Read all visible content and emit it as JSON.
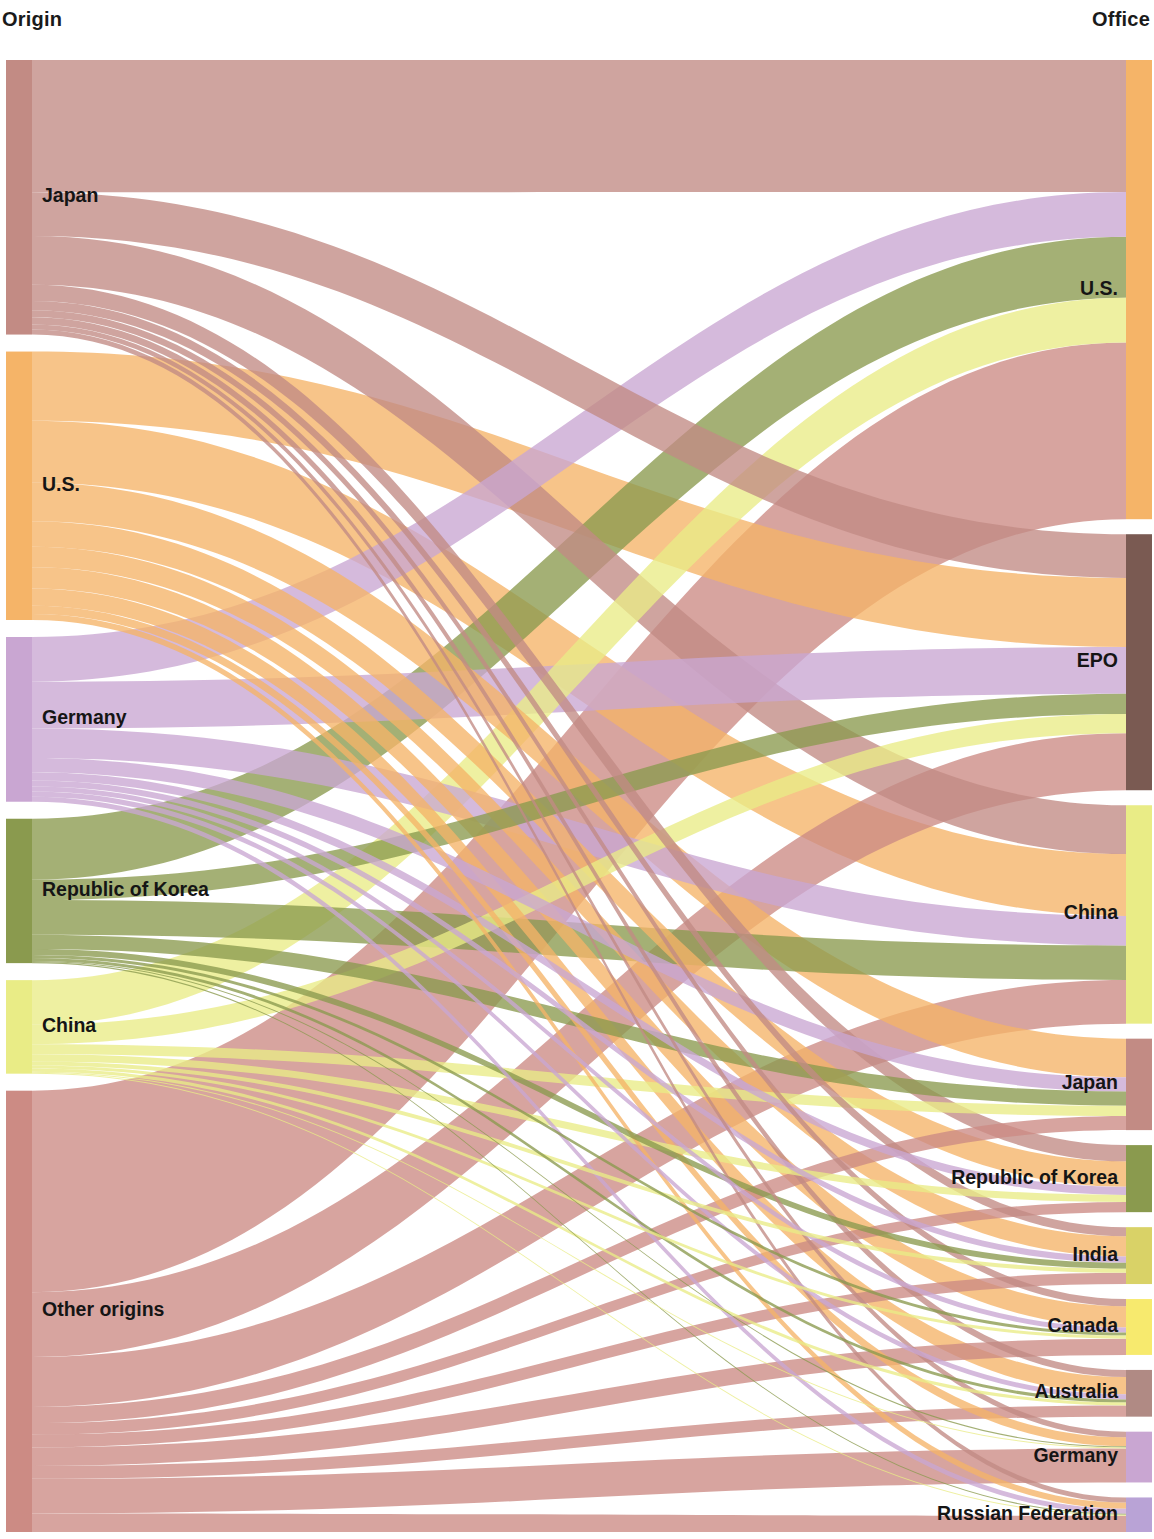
{
  "header": {
    "left_title": "Origin",
    "right_title": "Office"
  },
  "chart_data": {
    "type": "sankey",
    "xlabel": "",
    "ylabel": "",
    "legend_position": "none",
    "grid": false,
    "column_labels": [
      "Origin",
      "Office"
    ],
    "colors": {
      "Japan": "#c28b84",
      "U.S.": "#f5b468",
      "Germany": "#c9a6d2",
      "Republic of Korea": "#8a9a4e",
      "China": "#e9ec86",
      "Other origins": "#cc8b84",
      "EPO": "#7a5a52",
      "India": "#d9d267",
      "Canada": "#f7ea6e",
      "Australia": "#b08a84",
      "Russian Federation": "#b9a3d6"
    },
    "nodes_left": [
      {
        "id": "JP",
        "label": "Japan",
        "color": "#c28b84",
        "value": 270
      },
      {
        "id": "US",
        "label": "U.S.",
        "color": "#f5b468",
        "value": 264
      },
      {
        "id": "DE",
        "label": "Germany",
        "color": "#c9a6d2",
        "value": 162
      },
      {
        "id": "KR",
        "label": "Republic of Korea",
        "color": "#8a9a4e",
        "value": 142
      },
      {
        "id": "CN",
        "label": "China",
        "color": "#e9ec86",
        "value": 92
      },
      {
        "id": "OT",
        "label": "Other origins",
        "color": "#cc8b84",
        "value": 434
      }
    ],
    "nodes_right": [
      {
        "id": "oUS",
        "label": "U.S.",
        "color": "#f5b468",
        "value": 452
      },
      {
        "id": "oEPO",
        "label": "EPO",
        "color": "#7a5a52",
        "value": 252
      },
      {
        "id": "oCN",
        "label": "China",
        "color": "#e9ec86",
        "value": 215
      },
      {
        "id": "oJP",
        "label": "Japan",
        "color": "#c28b84",
        "value": 90
      },
      {
        "id": "oKR",
        "label": "Republic of Korea",
        "color": "#8a9a4e",
        "value": 66
      },
      {
        "id": "oIN",
        "label": "India",
        "color": "#d9d267",
        "value": 56
      },
      {
        "id": "oCA",
        "label": "Canada",
        "color": "#f7ea6e",
        "value": 55
      },
      {
        "id": "oAU",
        "label": "Australia",
        "color": "#b08a84",
        "value": 46
      },
      {
        "id": "oDE",
        "label": "Germany",
        "color": "#c9a6d2",
        "value": 50
      },
      {
        "id": "oRU",
        "label": "Russian Federation",
        "color": "#b9a3d6",
        "value": 34
      }
    ],
    "links": [
      {
        "source": "JP",
        "target": "oUS",
        "value": 130,
        "color": "#c28b84"
      },
      {
        "source": "JP",
        "target": "oEPO",
        "value": 43,
        "color": "#c28b84"
      },
      {
        "source": "JP",
        "target": "oCN",
        "value": 48,
        "color": "#c28b84"
      },
      {
        "source": "JP",
        "target": "oKR",
        "value": 16,
        "color": "#c28b84"
      },
      {
        "source": "JP",
        "target": "oIN",
        "value": 9,
        "color": "#c28b84"
      },
      {
        "source": "JP",
        "target": "oCA",
        "value": 7,
        "color": "#c28b84"
      },
      {
        "source": "JP",
        "target": "oAU",
        "value": 7,
        "color": "#c28b84"
      },
      {
        "source": "JP",
        "target": "oDE",
        "value": 5,
        "color": "#c28b84"
      },
      {
        "source": "JP",
        "target": "oRU",
        "value": 5,
        "color": "#c28b84"
      },
      {
        "source": "US",
        "target": "oEPO",
        "value": 68,
        "color": "#f5b468"
      },
      {
        "source": "US",
        "target": "oCN",
        "value": 61,
        "color": "#f5b468"
      },
      {
        "source": "US",
        "target": "oJP",
        "value": 38,
        "color": "#f5b468"
      },
      {
        "source": "US",
        "target": "oKR",
        "value": 25,
        "color": "#f5b468"
      },
      {
        "source": "US",
        "target": "oIN",
        "value": 20,
        "color": "#f5b468"
      },
      {
        "source": "US",
        "target": "oCA",
        "value": 21,
        "color": "#f5b468"
      },
      {
        "source": "US",
        "target": "oAU",
        "value": 17,
        "color": "#f5b468"
      },
      {
        "source": "US",
        "target": "oDE",
        "value": 8,
        "color": "#f5b468"
      },
      {
        "source": "US",
        "target": "oRU",
        "value": 6,
        "color": "#f5b468"
      },
      {
        "source": "DE",
        "target": "oUS",
        "value": 44,
        "color": "#c9a6d2"
      },
      {
        "source": "DE",
        "target": "oEPO",
        "value": 46,
        "color": "#c9a6d2"
      },
      {
        "source": "DE",
        "target": "oCN",
        "value": 29,
        "color": "#c9a6d2"
      },
      {
        "source": "DE",
        "target": "oJP",
        "value": 14,
        "color": "#c9a6d2"
      },
      {
        "source": "DE",
        "target": "oKR",
        "value": 8,
        "color": "#c9a6d2"
      },
      {
        "source": "DE",
        "target": "oIN",
        "value": 6,
        "color": "#c9a6d2"
      },
      {
        "source": "DE",
        "target": "oCA",
        "value": 5,
        "color": "#c9a6d2"
      },
      {
        "source": "DE",
        "target": "oAU",
        "value": 5,
        "color": "#c9a6d2"
      },
      {
        "source": "DE",
        "target": "oRU",
        "value": 5,
        "color": "#c9a6d2"
      },
      {
        "source": "KR",
        "target": "oUS",
        "value": 60,
        "color": "#8a9a4e"
      },
      {
        "source": "KR",
        "target": "oEPO",
        "value": 20,
        "color": "#8a9a4e"
      },
      {
        "source": "KR",
        "target": "oCN",
        "value": 34,
        "color": "#8a9a4e"
      },
      {
        "source": "KR",
        "target": "oJP",
        "value": 14,
        "color": "#8a9a4e"
      },
      {
        "source": "KR",
        "target": "oIN",
        "value": 6,
        "color": "#8a9a4e"
      },
      {
        "source": "KR",
        "target": "oCA",
        "value": 3,
        "color": "#8a9a4e"
      },
      {
        "source": "KR",
        "target": "oAU",
        "value": 3,
        "color": "#8a9a4e"
      },
      {
        "source": "KR",
        "target": "oDE",
        "value": 1,
        "color": "#8a9a4e"
      },
      {
        "source": "KR",
        "target": "oRU",
        "value": 1,
        "color": "#8a9a4e"
      },
      {
        "source": "CN",
        "target": "oUS",
        "value": 44,
        "color": "#e9ec86"
      },
      {
        "source": "CN",
        "target": "oEPO",
        "value": 19,
        "color": "#e9ec86"
      },
      {
        "source": "CN",
        "target": "oJP",
        "value": 10,
        "color": "#e9ec86"
      },
      {
        "source": "CN",
        "target": "oKR",
        "value": 7,
        "color": "#e9ec86"
      },
      {
        "source": "CN",
        "target": "oIN",
        "value": 4,
        "color": "#e9ec86"
      },
      {
        "source": "CN",
        "target": "oCA",
        "value": 3,
        "color": "#e9ec86"
      },
      {
        "source": "CN",
        "target": "oAU",
        "value": 3,
        "color": "#e9ec86"
      },
      {
        "source": "CN",
        "target": "oDE",
        "value": 1,
        "color": "#e9ec86"
      },
      {
        "source": "CN",
        "target": "oRU",
        "value": 1,
        "color": "#e9ec86"
      },
      {
        "source": "OT",
        "target": "oUS",
        "value": 174,
        "color": "#cc8b84"
      },
      {
        "source": "OT",
        "target": "oEPO",
        "value": 56,
        "color": "#cc8b84"
      },
      {
        "source": "OT",
        "target": "oCN",
        "value": 43,
        "color": "#cc8b84"
      },
      {
        "source": "OT",
        "target": "oJP",
        "value": 14,
        "color": "#cc8b84"
      },
      {
        "source": "OT",
        "target": "oKR",
        "value": 10,
        "color": "#cc8b84"
      },
      {
        "source": "OT",
        "target": "oIN",
        "value": 11,
        "color": "#cc8b84"
      },
      {
        "source": "OT",
        "target": "oCA",
        "value": 16,
        "color": "#cc8b84"
      },
      {
        "source": "OT",
        "target": "oAU",
        "value": 11,
        "color": "#cc8b84"
      },
      {
        "source": "OT",
        "target": "oDE",
        "value": 30,
        "color": "#cc8b84"
      },
      {
        "source": "OT",
        "target": "oRU",
        "value": 16,
        "color": "#cc8b84"
      }
    ]
  },
  "labels": {
    "left": [
      "Japan",
      "U.S.",
      "Germany",
      "Republic of Korea",
      "China",
      "Other origins"
    ],
    "right": [
      "U.S.",
      "EPO",
      "China",
      "Japan",
      "Republic of Korea",
      "India",
      "Canada",
      "Australia",
      "Germany",
      "Russian Federation"
    ]
  }
}
